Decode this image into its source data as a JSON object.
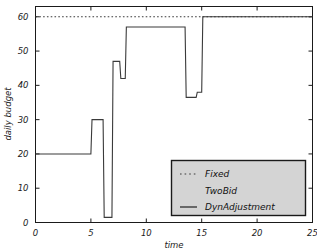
{
  "chart_data": {
    "type": "line",
    "title": "",
    "xlabel": "time",
    "ylabel": "daily budget",
    "xlim": [
      0,
      25
    ],
    "ylim": [
      0,
      63
    ],
    "xticks": [
      0,
      5,
      10,
      15,
      20,
      25
    ],
    "yticks": [
      0,
      10,
      20,
      30,
      40,
      50,
      60
    ],
    "grid": false,
    "legend_position": "lower right",
    "step_style": "post",
    "series": [
      {
        "name": "Fixed",
        "style": "dotted",
        "color": "#3a3a3a",
        "x": [
          0,
          25
        ],
        "values": [
          60,
          60
        ]
      },
      {
        "name": "TwoBid",
        "style": "none",
        "color": "#3a3a3a",
        "x": [],
        "values": []
      },
      {
        "name": "DynAdjustment",
        "style": "solid",
        "color": "#3a3a3a",
        "x": [
          0,
          5.0,
          5.1,
          6.1,
          6.2,
          6.9,
          7.0,
          7.6,
          7.7,
          8.1,
          8.2,
          13.5,
          13.6,
          14.5,
          14.6,
          15.0,
          15.1,
          25
        ],
        "values": [
          20,
          20,
          30,
          30,
          1.5,
          1.5,
          47,
          47,
          42,
          42,
          57,
          57,
          36.5,
          36.5,
          38,
          38,
          60,
          60
        ]
      }
    ]
  },
  "axes": {
    "ylabel": "daily budget",
    "xlabel": "time",
    "xtick_labels": [
      "0",
      "5",
      "10",
      "15",
      "20",
      "25"
    ],
    "ytick_labels": [
      "0",
      "10",
      "20",
      "30",
      "40",
      "50",
      "60"
    ]
  },
  "legend": {
    "entries": [
      {
        "label": "Fixed",
        "marker": "dotted-line-swatch"
      },
      {
        "label": "TwoBid",
        "marker": "blank-swatch"
      },
      {
        "label": "DynAdjustment",
        "marker": "solid-line-swatch"
      }
    ],
    "background_color": "#d4d4d4",
    "border_color": "#1a1a1a"
  },
  "colors": {
    "line": "#3a3a3a",
    "axis": "#1a1a1a",
    "background": "#ffffff"
  }
}
